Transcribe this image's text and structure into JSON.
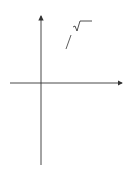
{
  "figure": {
    "curve_label": "y = ∛√x",
    "curve_label_parts": {
      "lhs": "y",
      "eq": "=",
      "root_index": "3",
      "radicand": "x"
    },
    "axes": {
      "x_label": "x",
      "y_label": "y"
    },
    "x_ticks": [
      {
        "value": 0,
        "label": "0"
      },
      {
        "value": 2,
        "label": "2"
      }
    ],
    "y_ticks": [
      {
        "value": 1,
        "label": "1"
      },
      {
        "value": 0.5,
        "label": ""
      },
      {
        "value": -0.5,
        "label": ""
      },
      {
        "value": -1,
        "label": "−1"
      }
    ],
    "solid": {
      "description": "solid of revolution of y = cube root of x about the x-axis from x=0 to x=2",
      "x_range": [
        0,
        2
      ],
      "marked_points": [
        {
          "x": 2,
          "y": 1
        },
        {
          "x": 2,
          "y": -1
        }
      ]
    },
    "colors": {
      "fill": "#e6e6e6",
      "stroke": "#333333",
      "point": "#111111"
    }
  }
}
